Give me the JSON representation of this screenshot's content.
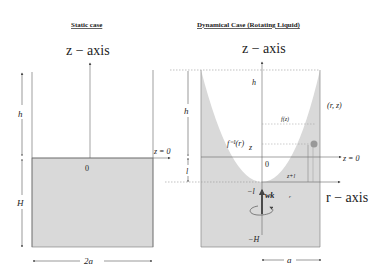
{
  "static_case": {
    "title": "Static case",
    "axis_label": "z − axis",
    "height_above": "h",
    "depth": "H",
    "origin": "0",
    "surface_label": "z = 0",
    "width": "2a"
  },
  "dynamical_case": {
    "title": "Dynamical Case (Rotating Liquid)",
    "axis_label": "z − axis",
    "r_axis_label": "r − axis",
    "height_top": "h",
    "height_left": "h",
    "l_label": "l",
    "inverse_fn": "f⁻¹(r)",
    "fn": "f(z)",
    "point": "(r, z)",
    "z_label": "z",
    "surface_label": "z = 0",
    "origin": "0",
    "z_plus_l": "z+l",
    "minus_l": "−l",
    "omega": "wk",
    "r_small": "r",
    "minus_H": "−H",
    "radius": "a"
  },
  "colors": {
    "liquid": "#d9d9d9",
    "lines": "#555555",
    "dashed": "#888888",
    "point": "#999999"
  }
}
